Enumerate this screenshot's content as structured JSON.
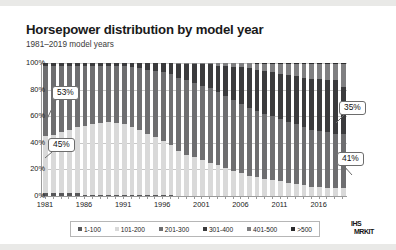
{
  "title": "Horsepower distribution by model year",
  "subtitle": "1981–2019 model years",
  "logo": {
    "line1": "IHS",
    "line2": "MRKIT"
  },
  "legend": {
    "items": [
      {
        "label": "1-100",
        "color": "#58585a"
      },
      {
        "label": "101-200",
        "color": "#d9d9d9"
      },
      {
        "label": "201-300",
        "color": "#6e6e70"
      },
      {
        "label": "301-400",
        "color": "#3b3b3d"
      },
      {
        "label": "401-500",
        "color": "#7f7f81"
      },
      {
        "label": ">500",
        "color": "#2b2b2d"
      }
    ]
  },
  "callouts": [
    {
      "name": "callout-53",
      "text": "53%",
      "x": 52,
      "y": 80,
      "tail": {
        "x1": 56,
        "y1": 94,
        "x2": 47,
        "y2": 113
      }
    },
    {
      "name": "callout-45",
      "text": "45%",
      "x": 48,
      "y": 132,
      "tail": {
        "x1": 52,
        "y1": 146,
        "x2": 45,
        "y2": 152
      }
    },
    {
      "name": "callout-35",
      "text": "35%",
      "x": 339,
      "y": 95,
      "tail": {
        "x1": 344,
        "y1": 109,
        "x2": 336,
        "y2": 117
      }
    },
    {
      "name": "callout-41",
      "text": "41%",
      "x": 337,
      "y": 146,
      "tail": {
        "x1": 344,
        "y1": 160,
        "x2": 352,
        "y2": 169
      }
    }
  ],
  "chart_data": {
    "type": "bar",
    "stacked": true,
    "normalized_percent": true,
    "title": "Horsepower distribution by model year",
    "subtitle": "1981–2019 model years",
    "xlabel": "",
    "ylabel": "",
    "ylim": [
      0,
      100
    ],
    "yticks": [
      "0%",
      "20%",
      "40%",
      "60%",
      "80%",
      "100%"
    ],
    "ytick_values": [
      0,
      20,
      40,
      60,
      80,
      100
    ],
    "grid": true,
    "legend_position": "bottom",
    "xtick_labels": [
      "1981",
      "1986",
      "1991",
      "1996",
      "2001",
      "2006",
      "2011",
      "2016"
    ],
    "xtick_values": [
      1981,
      1986,
      1991,
      1996,
      2001,
      2006,
      2011,
      2016
    ],
    "categories": [
      1981,
      1982,
      1983,
      1984,
      1985,
      1986,
      1987,
      1988,
      1989,
      1990,
      1991,
      1992,
      1993,
      1994,
      1995,
      1996,
      1997,
      1998,
      1999,
      2000,
      2001,
      2002,
      2003,
      2004,
      2005,
      2006,
      2007,
      2008,
      2009,
      2010,
      2011,
      2012,
      2013,
      2014,
      2015,
      2016,
      2017,
      2018,
      2019
    ],
    "series": [
      {
        "name": "1-100",
        "color": "#58585a",
        "values": [
          2,
          2,
          2,
          2,
          2,
          1,
          1,
          1,
          1,
          1,
          1,
          1,
          1,
          1,
          1,
          1,
          1,
          0,
          0,
          0,
          0,
          0,
          0,
          0,
          0,
          0,
          0,
          0,
          0,
          0,
          0,
          0,
          0,
          0,
          0,
          0,
          0,
          0,
          0
        ]
      },
      {
        "name": "101-200",
        "color": "#d9d9d9",
        "values": [
          43,
          44,
          46,
          48,
          50,
          52,
          53,
          54,
          55,
          54,
          53,
          51,
          49,
          46,
          43,
          40,
          37,
          34,
          31,
          29,
          27,
          25,
          23,
          21,
          19,
          17,
          15,
          14,
          13,
          12,
          11,
          10,
          9,
          8,
          7,
          7,
          6,
          6,
          6
        ]
      },
      {
        "name": "201-300",
        "color": "#6e6e70",
        "values": [
          53,
          52,
          50,
          48,
          46,
          45,
          44,
          43,
          42,
          43,
          44,
          45,
          46,
          48,
          50,
          52,
          54,
          55,
          56,
          56,
          56,
          56,
          55,
          54,
          53,
          52,
          51,
          50,
          49,
          48,
          47,
          46,
          45,
          44,
          43,
          42,
          42,
          41,
          41
        ]
      },
      {
        "name": "301-400",
        "color": "#3b3b3d",
        "values": [
          2,
          2,
          2,
          2,
          2,
          2,
          2,
          2,
          2,
          2,
          2,
          3,
          4,
          5,
          6,
          7,
          8,
          10,
          12,
          14,
          16,
          18,
          20,
          23,
          25,
          28,
          30,
          31,
          32,
          33,
          34,
          35,
          36,
          37,
          38,
          39,
          39,
          40,
          35
        ]
      },
      {
        "name": "401-500",
        "color": "#7f7f81",
        "values": [
          0,
          0,
          0,
          0,
          0,
          0,
          0,
          0,
          0,
          0,
          0,
          0,
          0,
          0,
          0,
          0,
          0,
          1,
          1,
          1,
          1,
          1,
          2,
          2,
          3,
          3,
          4,
          4,
          5,
          6,
          7,
          8,
          9,
          10,
          11,
          11,
          12,
          12,
          17
        ]
      },
      {
        "name": ">500",
        "color": "#2b2b2d",
        "values": [
          0,
          0,
          0,
          0,
          0,
          0,
          0,
          0,
          0,
          0,
          0,
          0,
          0,
          0,
          0,
          0,
          0,
          0,
          0,
          0,
          0,
          0,
          0,
          0,
          0,
          0,
          0,
          1,
          1,
          1,
          1,
          1,
          1,
          1,
          1,
          1,
          1,
          1,
          1
        ]
      }
    ],
    "annotations": [
      {
        "text": "53%",
        "series": "201-300",
        "year": 1981
      },
      {
        "text": "45%",
        "series": "101-200",
        "year": 1981
      },
      {
        "text": "35%",
        "series": "301-400",
        "year": 2019
      },
      {
        "text": "41%",
        "series": "201-300",
        "year": 2019
      }
    ]
  }
}
